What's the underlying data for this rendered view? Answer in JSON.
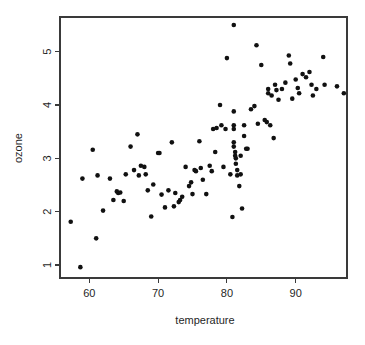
{
  "chart_data": {
    "type": "scatter",
    "title": "",
    "subtitle": "",
    "xlabel": "temperature",
    "ylabel": "ozone",
    "xlim": [
      56,
      98
    ],
    "ylim": [
      0.8,
      5.7
    ],
    "xticks": [
      60,
      70,
      80,
      90
    ],
    "xtick_labels": [
      "60",
      "70",
      "80",
      "90"
    ],
    "yticks": [
      1,
      2,
      3,
      4,
      5
    ],
    "ytick_labels": [
      "1",
      "2",
      "3",
      "4",
      "5"
    ],
    "grid": false,
    "legend": null,
    "legend_position": "none",
    "marker": "filled-circle",
    "marker_color": "#111111",
    "marker_size_px": 2.3,
    "axis_color": "#3a3a3a",
    "background_color": "#ffffff",
    "box_border": true,
    "x": [
      57.3,
      58.7,
      59.0,
      61.0,
      61.2,
      62.0,
      63.5,
      64.0,
      64.2,
      64.5,
      65.0,
      65.3,
      66.0,
      66.5,
      67.0,
      67.2,
      67.5,
      68.0,
      68.2,
      68.5,
      69.0,
      69.3,
      70.0,
      70.5,
      71.0,
      71.5,
      72.0,
      72.3,
      72.5,
      73.0,
      73.2,
      73.5,
      74.0,
      74.5,
      75.0,
      75.3,
      75.5,
      76.0,
      76.2,
      76.5,
      77.0,
      77.5,
      78.0,
      78.3,
      78.5,
      79.0,
      79.2,
      79.5,
      80.0,
      80.5,
      80.8,
      81.0,
      81.0,
      81.0,
      81.0,
      81.0,
      81.0,
      81.2,
      81.2,
      81.3,
      81.3,
      81.5,
      81.5,
      81.8,
      82.0,
      82.0,
      82.2,
      82.5,
      82.5,
      83.0,
      83.5,
      84.0,
      84.3,
      84.5,
      85.0,
      85.5,
      86.0,
      86.0,
      86.3,
      86.5,
      86.8,
      87.0,
      87.2,
      87.5,
      88.0,
      88.5,
      89.0,
      89.2,
      89.5,
      90.0,
      90.3,
      90.5,
      91.0,
      91.5,
      92.0,
      92.3,
      92.5,
      93.0,
      94.0,
      94.2,
      96.0,
      97.0,
      60.5,
      63.0,
      70.2,
      74.8,
      77.8,
      79.8,
      82.8,
      85.8
    ],
    "y": [
      1.81,
      0.96,
      2.62,
      1.5,
      2.68,
      2.02,
      2.22,
      2.38,
      2.35,
      2.36,
      2.2,
      2.7,
      3.22,
      2.78,
      3.45,
      2.68,
      2.86,
      2.84,
      2.7,
      2.4,
      1.91,
      2.51,
      3.1,
      2.32,
      2.08,
      2.4,
      3.3,
      2.1,
      2.35,
      2.18,
      2.22,
      2.28,
      2.84,
      2.48,
      2.33,
      2.78,
      2.76,
      3.32,
      2.82,
      2.6,
      2.33,
      2.86,
      3.55,
      3.12,
      3.57,
      4.0,
      3.62,
      2.84,
      4.88,
      2.7,
      1.9,
      5.5,
      3.88,
      3.62,
      3.55,
      3.3,
      3.22,
      3.12,
      3.05,
      3.0,
      2.9,
      2.78,
      2.68,
      2.48,
      3.05,
      2.7,
      2.06,
      3.42,
      3.62,
      3.18,
      3.92,
      3.98,
      5.12,
      3.65,
      4.75,
      3.72,
      4.3,
      4.22,
      3.62,
      4.18,
      3.38,
      4.38,
      4.28,
      4.1,
      4.3,
      4.42,
      4.93,
      4.78,
      4.12,
      4.48,
      4.32,
      4.22,
      4.58,
      4.52,
      4.62,
      4.38,
      4.18,
      4.3,
      4.9,
      4.38,
      4.35,
      4.22,
      3.16,
      2.62,
      3.1,
      2.55,
      2.76,
      3.55,
      3.18,
      3.68
    ]
  },
  "axis": {
    "x_title": "temperature",
    "y_title": "ozone"
  }
}
